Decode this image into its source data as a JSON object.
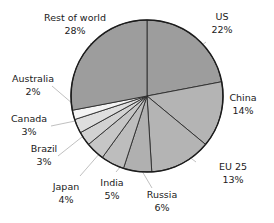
{
  "chart_data": {
    "type": "pie",
    "title": "",
    "subtitle": "",
    "xlabel": "",
    "ylabel": "",
    "legend_position": "none",
    "grid": false,
    "units": "percent",
    "start_angle_deg": 0,
    "direction": "clockwise",
    "categories": [
      "US",
      "China",
      "EU 25",
      "Russia",
      "India",
      "Japan",
      "Brazil",
      "Canada",
      "Australia",
      "Rest of world"
    ],
    "values": [
      22,
      14,
      13,
      6,
      5,
      4,
      3,
      3,
      2,
      28
    ],
    "slices": [
      {
        "name": "US",
        "label": "US",
        "value": 22,
        "value_text": "22%",
        "color": "#9d9d9d"
      },
      {
        "name": "China",
        "label": "China",
        "value": 14,
        "value_text": "14%",
        "color": "#b4b4b4"
      },
      {
        "name": "EU 25",
        "label": "EU 25",
        "value": 13,
        "value_text": "13%",
        "color": "#b4b4b4"
      },
      {
        "name": "Russia",
        "label": "Russia",
        "value": 6,
        "value_text": "6%",
        "color": "#b0b0b0"
      },
      {
        "name": "India",
        "label": "India",
        "value": 5,
        "value_text": "5%",
        "color": "#bdbdbd"
      },
      {
        "name": "Japan",
        "label": "Japan",
        "value": 4,
        "value_text": "4%",
        "color": "#c6c6c6"
      },
      {
        "name": "Brazil",
        "label": "Brazil",
        "value": 3,
        "value_text": "3%",
        "color": "#d2d2d2"
      },
      {
        "name": "Canada",
        "label": "Canada",
        "value": 3,
        "value_text": "3%",
        "color": "#dedede"
      },
      {
        "name": "Australia",
        "label": "Australia",
        "value": 2,
        "value_text": "2%",
        "color": "#f4f4f4"
      },
      {
        "name": "Rest of world",
        "label": "Rest of world",
        "value": 28,
        "value_text": "28%",
        "color": "#9d9d9d"
      }
    ],
    "colors": {
      "outline": "#1c1c1c",
      "slice_divider": "#2b2b2b",
      "leader_line": "#b0b0b0",
      "label_text": "#1a1a1a",
      "background": "#ffffff"
    }
  },
  "labels": {
    "rest_of_world": {
      "name": "Rest of world",
      "value": "28%"
    },
    "us": {
      "name": "US",
      "value": "22%"
    },
    "china": {
      "name": "China",
      "value": "14%"
    },
    "eu25": {
      "name": "EU 25",
      "value": "13%"
    },
    "russia": {
      "name": "Russia",
      "value": "6%"
    },
    "india": {
      "name": "India",
      "value": "5%"
    },
    "japan": {
      "name": "Japan",
      "value": "4%"
    },
    "brazil": {
      "name": "Brazil",
      "value": "3%"
    },
    "canada": {
      "name": "Canada",
      "value": "3%"
    },
    "australia": {
      "name": "Australia",
      "value": "2%"
    }
  }
}
